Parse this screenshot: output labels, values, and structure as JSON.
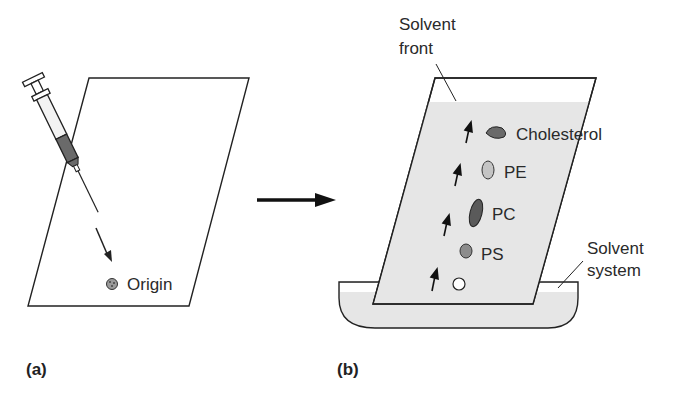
{
  "panels": {
    "a": {
      "label": "(a)",
      "origin_label": "Origin"
    },
    "b": {
      "label": "(b)",
      "solvent_front_line1": "Solvent",
      "solvent_front_line2": "front",
      "solvent_system_line1": "Solvent",
      "solvent_system_line2": "system",
      "spots": [
        {
          "name": "Cholesterol",
          "label": "Cholesterol"
        },
        {
          "name": "PE",
          "label": "PE"
        },
        {
          "name": "PC",
          "label": "PC"
        },
        {
          "name": "PS",
          "label": "PS"
        }
      ]
    }
  },
  "colors": {
    "plate_fill": "#e6e6e6",
    "line": "#222222",
    "spot_dark": "#5a5a5a",
    "spot_mid": "#8c8c8c",
    "spot_light": "#c4c4c4"
  }
}
